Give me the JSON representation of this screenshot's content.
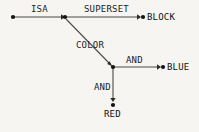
{
  "diagram": {
    "type": "semantic-network",
    "background_color": "#f6f5f2",
    "line_color": "#4b4b4b",
    "text_color": "#1d1d1d",
    "nodes": [
      {
        "id": "n-source",
        "name": "source-node",
        "label": "",
        "x": 13,
        "y": 17
      },
      {
        "id": "n-hub1",
        "name": "isa-junction-node",
        "label": "",
        "x": 65,
        "y": 17
      },
      {
        "id": "n-block",
        "name": "block-node",
        "label": "BLOCK",
        "x": 143,
        "y": 17
      },
      {
        "id": "n-hub2",
        "name": "color-junction-node",
        "label": "",
        "x": 113,
        "y": 67
      },
      {
        "id": "n-blue",
        "name": "blue-node",
        "label": "BLUE",
        "x": 163,
        "y": 67
      },
      {
        "id": "n-red",
        "name": "red-node",
        "label": "RED",
        "x": 113,
        "y": 105
      }
    ],
    "edges": [
      {
        "id": "e-isa",
        "name": "edge-isa",
        "label": "ISA",
        "from": "n-source",
        "to": "n-hub1",
        "label_x": 31,
        "label_y": 5
      },
      {
        "id": "e-superset",
        "name": "edge-superset",
        "label": "SUPERSET",
        "from": "n-hub1",
        "to": "n-block",
        "label_x": 84,
        "label_y": 5
      },
      {
        "id": "e-color",
        "name": "edge-color",
        "label": "COLOR",
        "from": "n-hub1",
        "to": "n-hub2",
        "label_x": 76,
        "label_y": 41
      },
      {
        "id": "e-and-blue",
        "name": "edge-and-blue",
        "label": "AND",
        "from": "n-hub2",
        "to": "n-blue",
        "label_x": 126,
        "label_y": 56
      },
      {
        "id": "e-and-red",
        "name": "edge-and-red",
        "label": "AND",
        "from": "n-hub2",
        "to": "n-red",
        "label_x": 94,
        "label_y": 83
      }
    ],
    "node_labels": [
      {
        "id": "l-block",
        "name": "node-label-block",
        "text": "BLOCK",
        "x": 147,
        "y": 13
      },
      {
        "id": "l-blue",
        "name": "node-label-blue",
        "text": "BLUE",
        "x": 167,
        "y": 63
      },
      {
        "id": "l-red",
        "name": "node-label-red",
        "text": "RED",
        "x": 104,
        "y": 110
      }
    ]
  }
}
